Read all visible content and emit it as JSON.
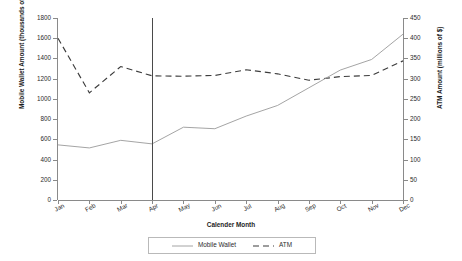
{
  "chart_data": {
    "type": "line",
    "title": "",
    "xlabel": "Calender Month",
    "categories": [
      "Jan",
      "Feb",
      "Mar",
      "Apr",
      "May",
      "Jun",
      "Jul",
      "Aug",
      "Sep",
      "Oct",
      "Nov",
      "Dec"
    ],
    "grid": false,
    "legend_position": "bottom",
    "axes": {
      "left": {
        "label": "Mobile Wallet Amount (thousands of $)",
        "ylim": [
          0,
          1800
        ],
        "tick_step": 200,
        "ticks": [
          0,
          200,
          400,
          600,
          800,
          1000,
          1200,
          1400,
          1600,
          1800
        ]
      },
      "right": {
        "label": "ATM Amount (millions of $)",
        "ylim": [
          0,
          450
        ],
        "tick_step": 50,
        "ticks": [
          0,
          50,
          100,
          150,
          200,
          250,
          300,
          350,
          400,
          450
        ]
      }
    },
    "series": [
      {
        "name": "Mobile Wallet",
        "axis": "left",
        "style": "solid",
        "color": "#9a9a9a",
        "units": "thousands of $",
        "values": [
          545,
          515,
          590,
          555,
          720,
          705,
          830,
          935,
          1110,
          1285,
          1390,
          1640
        ]
      },
      {
        "name": "ATM",
        "axis": "right",
        "style": "dashed",
        "color": "#3d3d3d",
        "units": "millions of $",
        "values": [
          400,
          265,
          330,
          307,
          306,
          308,
          322,
          312,
          296,
          305,
          308,
          344
        ]
      }
    ],
    "annotations": [
      {
        "type": "vertical-reference-line",
        "at_category": "Apr",
        "color": "#4a4a4a"
      }
    ]
  },
  "legend": {
    "items": [
      {
        "label": "Mobile Wallet",
        "style": "solid"
      },
      {
        "label": "ATM",
        "style": "dashed"
      }
    ]
  }
}
